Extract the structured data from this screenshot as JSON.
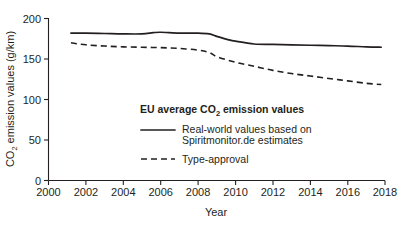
{
  "chart_data": {
    "type": "line",
    "title": "",
    "xlabel": "Year",
    "ylabel": "CO2 emission values (g/km)",
    "ylabel_parts": {
      "pre": "CO",
      "sub": "2",
      "post": " emission values (g/km)"
    },
    "xlim": [
      2000,
      2018
    ],
    "ylim": [
      0,
      200
    ],
    "xticks": [
      2000,
      2002,
      2004,
      2006,
      2008,
      2010,
      2012,
      2014,
      2016,
      2018
    ],
    "xticklabels": [
      "2000",
      "2002",
      "2004",
      "2006",
      "2008",
      "2010",
      "2012",
      "2014",
      "2016",
      "2018"
    ],
    "yticks": [
      0,
      50,
      100,
      150,
      200
    ],
    "yticklabels": [
      "0",
      "50",
      "100",
      "150",
      "200"
    ],
    "grid": false,
    "legend_position": "center",
    "legend_title": "EU average CO2 emission values",
    "legend_title_parts": {
      "pre": "EU average CO",
      "sub": "2",
      "post": " emission values"
    },
    "series": [
      {
        "name": "Real-world values based on Spiritmonitor.de estimates",
        "label_line1": "Real-world values based on",
        "label_line2": "Spiritmonitor.de estimates",
        "style": "solid",
        "color": "#231f20",
        "x": [
          2001.2,
          2002,
          2003,
          2004,
          2005,
          2005.6,
          2006,
          2007,
          2008,
          2008.6,
          2009,
          2009.6,
          2010,
          2011,
          2012,
          2013,
          2014,
          2015,
          2016,
          2017,
          2017.8
        ],
        "values": [
          182,
          182,
          181.5,
          181,
          181,
          182.5,
          183,
          182,
          182,
          181,
          178,
          174,
          172,
          168.5,
          168,
          167.5,
          167,
          166.5,
          166,
          165,
          164.5
        ]
      },
      {
        "name": "Type-approval",
        "label_line1": "Type-approval",
        "label_line2": "",
        "style": "dashed",
        "color": "#231f20",
        "x": [
          2001.2,
          2002,
          2003,
          2004,
          2005,
          2006,
          2007,
          2008,
          2008.6,
          2009,
          2010,
          2011,
          2012,
          2013,
          2014,
          2015,
          2016,
          2017,
          2017.8
        ],
        "values": [
          170,
          167.5,
          166,
          165,
          164.5,
          164,
          163,
          161,
          158,
          153,
          146,
          141,
          136,
          132,
          129,
          126,
          123,
          120,
          118.5
        ]
      }
    ]
  }
}
